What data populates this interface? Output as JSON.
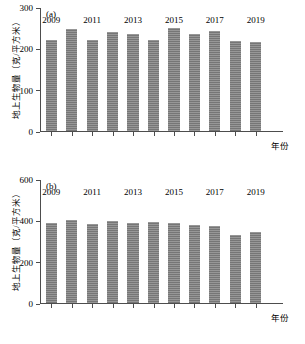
{
  "figure": {
    "axis_title_x": "年份",
    "axis_title_y": "地上生物量（克/平方米）"
  },
  "panels": {
    "a": {
      "label": "(a)"
    },
    "b": {
      "label": "(b)"
    }
  },
  "chart_data": [
    {
      "type": "bar",
      "panel": "(a)",
      "title": "",
      "xlabel": "年份",
      "ylabel": "地上生物量（克/平方米）",
      "categories": [
        "2009",
        "2010",
        "2011",
        "2012",
        "2013",
        "2014",
        "2015",
        "2016",
        "2017",
        "2018",
        "2019"
      ],
      "tick_labels_x": [
        "2009",
        "2011",
        "2013",
        "2015",
        "2017",
        "2019"
      ],
      "tick_labels_y": [
        "0",
        "100",
        "200",
        "300"
      ],
      "values": [
        222,
        248,
        223,
        241,
        237,
        223,
        251,
        236,
        245,
        220,
        217
      ],
      "ylim": [
        0,
        300
      ],
      "yticks": [
        0,
        100,
        200,
        300
      ],
      "grid": false,
      "legend": "none",
      "bar_color": "#7d7d7d"
    },
    {
      "type": "bar",
      "panel": "(b)",
      "title": "",
      "xlabel": "年份",
      "ylabel": "地上生物量（克/平方米）",
      "categories": [
        "2009",
        "2010",
        "2011",
        "2012",
        "2013",
        "2014",
        "2015",
        "2016",
        "2017",
        "2018",
        "2019"
      ],
      "tick_labels_x": [
        "2009",
        "2011",
        "2013",
        "2015",
        "2017",
        "2019"
      ],
      "tick_labels_y": [
        "0",
        "200",
        "400",
        "600"
      ],
      "values": [
        388,
        404,
        384,
        400,
        390,
        393,
        389,
        382,
        378,
        330,
        345
      ],
      "ylim": [
        0,
        600
      ],
      "yticks": [
        0,
        200,
        400,
        600
      ],
      "grid": false,
      "legend": "none",
      "bar_color": "#7d7d7d"
    }
  ]
}
